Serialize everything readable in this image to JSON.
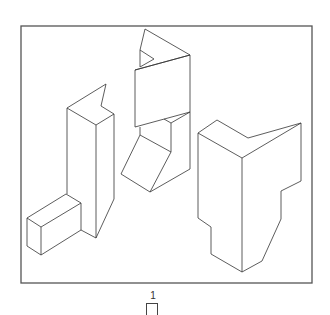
{
  "figure": {
    "label": "1",
    "frame": {
      "x": 21,
      "y": 26,
      "width": 291,
      "height": 257
    },
    "objects": [
      {
        "name": "left-tall-block-with-step",
        "polylines": [
          [
            [
              67,
              108
            ],
            [
              106,
              84
            ],
            [
              101,
              106
            ],
            [
              114,
              114
            ],
            [
              96,
              125
            ],
            [
              67,
              108
            ]
          ],
          [
            [
              106,
              84
            ],
            [
              106,
              84
            ]
          ],
          [
            [
              67,
              108
            ],
            [
              67,
              194
            ]
          ],
          [
            [
              96,
              125
            ],
            [
              96,
              238
            ]
          ],
          [
            [
              114,
              114
            ],
            [
              114,
              199
            ],
            [
              96,
              238
            ]
          ],
          [
            [
              27,
              218
            ],
            [
              66,
              194
            ],
            [
              81,
              203
            ],
            [
              41,
              227
            ],
            [
              27,
              218
            ]
          ],
          [
            [
              27,
              218
            ],
            [
              27,
              246
            ],
            [
              41,
              255
            ],
            [
              41,
              227
            ]
          ],
          [
            [
              41,
              255
            ],
            [
              81,
              230
            ],
            [
              81,
              203
            ]
          ],
          [
            [
              81,
              230
            ],
            [
              96,
              238
            ]
          ]
        ]
      },
      {
        "name": "middle-twisted-column",
        "polylines": [
          [
            [
              145,
              29
            ],
            [
              190,
              55
            ],
            [
              135,
              70
            ]
          ],
          [
            [
              145,
              29
            ],
            [
              140,
              50
            ],
            [
              154,
              59
            ],
            [
              140,
              67
            ]
          ],
          [
            [
              140,
              50
            ],
            [
              140,
              67
            ]
          ],
          [
            [
              135,
              70
            ],
            [
              190,
              55
            ]
          ],
          [
            [
              135,
              70
            ],
            [
              135,
              127
            ],
            [
              190,
              112
            ],
            [
              190,
              55
            ]
          ],
          [
            [
              190,
              112
            ],
            [
              190,
              169
            ],
            [
              150,
              192
            ]
          ],
          [
            [
              164,
              119
            ],
            [
              171,
              123
            ],
            [
              190,
              112
            ]
          ],
          [
            [
              171,
              123
            ],
            [
              171,
              152
            ]
          ],
          [
            [
              140,
              127
            ],
            [
              140,
              135
            ],
            [
              171,
              152
            ],
            [
              150,
              192
            ],
            [
              121,
              174
            ],
            [
              140,
              135
            ]
          ]
        ]
      },
      {
        "name": "right-notched-block",
        "polylines": [
          [
            [
              198,
              133
            ],
            [
              217,
              120
            ],
            [
              248,
              138
            ],
            [
              301,
              123
            ],
            [
              242,
              158
            ],
            [
              198,
              133
            ]
          ],
          [
            [
              242,
              158
            ],
            [
              242,
              272
            ]
          ],
          [
            [
              198,
              133
            ],
            [
              198,
              218
            ],
            [
              211,
              227
            ],
            [
              211,
              254
            ],
            [
              242,
              272
            ],
            [
              262,
              261
            ],
            [
              281,
              219
            ],
            [
              281,
              191
            ],
            [
              301,
              181
            ],
            [
              301,
              123
            ]
          ]
        ]
      }
    ]
  },
  "colors": {
    "stroke": "#333333",
    "frame": "#555555",
    "background": "#ffffff"
  }
}
